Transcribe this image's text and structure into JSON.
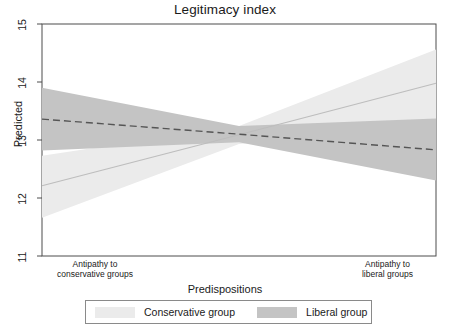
{
  "chart_data": {
    "type": "area",
    "title": "Legitimacy index",
    "xlabel": "Predispositions",
    "ylabel": "Predicted",
    "ylim": [
      11,
      15
    ],
    "yticks": [
      "11",
      "12",
      "13",
      "14",
      "15"
    ],
    "xlim": [
      0,
      1
    ],
    "xtick_labels": [
      {
        "line1": "Antipathy to",
        "line2": "conservative groups",
        "position": 0.06
      },
      {
        "line1": "Antipathy to",
        "line2": "liberal groups",
        "position": 0.945
      }
    ],
    "grid": false,
    "legend_position": "bottom",
    "series": [
      {
        "name": "Conservative group",
        "line_style": "solid",
        "line_color": "#bdbdbd",
        "band_color": "#ebebeb",
        "x": [
          0,
          0.5,
          1
        ],
        "fit": [
          12.21,
          13.09,
          13.98
        ],
        "lower": [
          11.66,
          12.93,
          13.21
        ],
        "upper": [
          12.73,
          13.24,
          14.56
        ]
      },
      {
        "name": "Liberal group",
        "line_style": "dashed",
        "line_color": "#555555",
        "band_color": "#c4c4c4",
        "x": [
          0,
          0.5,
          1
        ],
        "fit": [
          13.36,
          13.1,
          12.83
        ],
        "lower": [
          12.82,
          12.96,
          12.3
        ],
        "upper": [
          13.9,
          13.24,
          13.37
        ]
      }
    ]
  },
  "legend": {
    "items": [
      {
        "label": "Conservative group",
        "color": "#ebebeb"
      },
      {
        "label": "Liberal group",
        "color": "#c4c4c4"
      }
    ]
  },
  "colors": {
    "frame": "#4d4d4d",
    "background": "#ffffff",
    "text": "#1a1a1a",
    "conservative_band": "#ebebeb",
    "conservative_line": "#bdbdbd",
    "liberal_band": "#c4c4c4",
    "liberal_line": "#555555"
  }
}
